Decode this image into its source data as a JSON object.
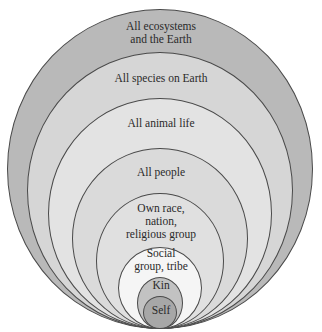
{
  "diagram": {
    "title": "",
    "rings": [
      {
        "id": "ecosystems",
        "lines": [
          "All ecosystems",
          "and the Earth"
        ],
        "color": "#b9b9b9",
        "left": 7,
        "top": 9,
        "width": 306,
        "height": 320,
        "label_top": 20
      },
      {
        "id": "species",
        "lines": [
          "All species on Earth"
        ],
        "color": "#d6d6d6",
        "left": 27,
        "top": 52,
        "width": 266,
        "height": 277,
        "label_top": 72
      },
      {
        "id": "animal",
        "lines": [
          "All animal life"
        ],
        "color": "#e3e3e3",
        "left": 48,
        "top": 98,
        "width": 224,
        "height": 231,
        "label_top": 117
      },
      {
        "id": "people",
        "lines": [
          "All people"
        ],
        "color": "#dadada",
        "left": 72,
        "top": 148,
        "width": 176,
        "height": 181,
        "label_top": 166
      },
      {
        "id": "own-race",
        "lines": [
          "Own race,",
          "nation,",
          "religious group"
        ],
        "color": "#e0e0e0",
        "left": 96,
        "top": 193,
        "width": 128,
        "height": 136,
        "label_top": 202
      },
      {
        "id": "social",
        "lines": [
          "Social",
          "group, tribe"
        ],
        "color": "#f5f5f5",
        "left": 118,
        "top": 247,
        "width": 84,
        "height": 82,
        "label_top": 247
      },
      {
        "id": "kin",
        "lines": [
          "Kin"
        ],
        "color": "#c2c2c2",
        "left": 137,
        "top": 277,
        "width": 46,
        "height": 52,
        "label_top": 279
      },
      {
        "id": "self",
        "lines": [
          "Self"
        ],
        "color": "#a7a7a7",
        "left": 143,
        "top": 296,
        "width": 34,
        "height": 33,
        "label_top": 304
      }
    ]
  }
}
